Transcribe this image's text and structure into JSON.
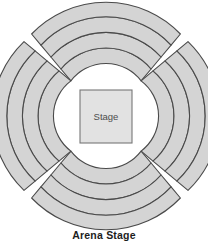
{
  "diagram": {
    "caption": "Arena Stage",
    "stage": {
      "label": "Stage",
      "shape": "square",
      "fill_color": "#e2e2e2",
      "border_color": "#777777",
      "center_x": 106,
      "center_y": 116,
      "width": 52,
      "height": 53
    },
    "canvas": {
      "width": 208,
      "height": 249,
      "background_color": "#ffffff"
    },
    "seating": {
      "fill_color": "#d4d4d4",
      "line_color": "#4a4a4a",
      "section_count": 4,
      "rows_per_section": 4,
      "inner_radius": 42,
      "outer_radius": 102,
      "sections": [
        {
          "name": "north-section",
          "position": "top",
          "start_angle": -70,
          "end_angle": -20,
          "rows": 4
        },
        {
          "name": "east-section",
          "position": "right",
          "start_angle": 20,
          "end_angle": 70,
          "rows": 4
        },
        {
          "name": "south-section",
          "position": "bottom",
          "start_angle": 110,
          "end_angle": 160,
          "rows": 4
        },
        {
          "name": "west-section",
          "position": "left",
          "start_angle": 200,
          "end_angle": 250,
          "rows": 4
        }
      ]
    }
  }
}
